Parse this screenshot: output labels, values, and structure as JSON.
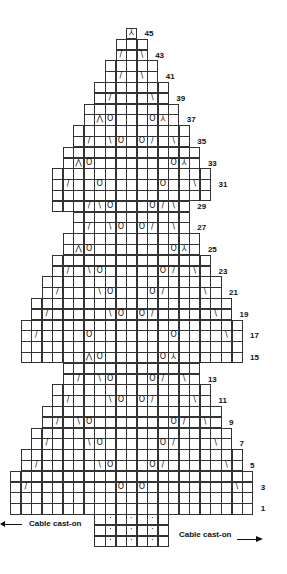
{
  "chart_data": {
    "type": "knitting-chart",
    "grid": {
      "left": 10,
      "top_row45": 28,
      "cell_w": 10.55,
      "cell_h": 10.8,
      "columns": 23
    },
    "rows": [
      {
        "n": 45,
        "range": [
          11,
          11
        ],
        "label": "45",
        "symbols": [
          [
            11,
            "sk2p"
          ]
        ]
      },
      {
        "n": 44,
        "range": [
          10,
          12
        ]
      },
      {
        "n": 43,
        "range": [
          10,
          12
        ],
        "label": "43",
        "symbols": [
          [
            10,
            "k2tog"
          ],
          [
            12,
            "ssk"
          ]
        ]
      },
      {
        "n": 42,
        "range": [
          9,
          13
        ]
      },
      {
        "n": 41,
        "range": [
          9,
          13
        ],
        "label": "41",
        "symbols": [
          [
            10,
            "k2tog"
          ],
          [
            12,
            "ssk"
          ]
        ]
      },
      {
        "n": 40,
        "range": [
          8,
          14
        ]
      },
      {
        "n": 39,
        "range": [
          8,
          14
        ],
        "label": "39",
        "symbols": [
          [
            9,
            "k2tog"
          ],
          [
            13,
            "ssk"
          ]
        ]
      },
      {
        "n": 38,
        "range": [
          7,
          15
        ]
      },
      {
        "n": 37,
        "range": [
          7,
          15
        ],
        "label": "37",
        "symbols": [
          [
            8,
            "k3tog"
          ],
          [
            9,
            "yo"
          ],
          [
            13,
            "yo"
          ],
          [
            14,
            "sk2p"
          ]
        ]
      },
      {
        "n": 36,
        "range": [
          6,
          16
        ]
      },
      {
        "n": 35,
        "range": [
          6,
          16
        ],
        "label": "35",
        "symbols": [
          [
            7,
            "k2tog"
          ],
          [
            9,
            "ssk"
          ],
          [
            10,
            "yo"
          ],
          [
            12,
            "yo"
          ],
          [
            13,
            "k2tog"
          ],
          [
            15,
            "ssk"
          ]
        ]
      },
      {
        "n": 34,
        "range": [
          5,
          17
        ]
      },
      {
        "n": 33,
        "range": [
          5,
          17
        ],
        "label": "33",
        "symbols": [
          [
            6,
            "k3tog"
          ],
          [
            7,
            "yo"
          ],
          [
            15,
            "yo"
          ],
          [
            16,
            "sk2p"
          ]
        ]
      },
      {
        "n": 32,
        "range": [
          4,
          18
        ]
      },
      {
        "n": 31,
        "range": [
          4,
          18
        ],
        "label": "31",
        "symbols": [
          [
            5,
            "k2tog"
          ],
          [
            8,
            "yo"
          ],
          [
            14,
            "yo"
          ],
          [
            17,
            "ssk"
          ]
        ]
      },
      {
        "n": 30,
        "range": [
          4,
          18
        ]
      },
      {
        "n": 29,
        "range": [
          4,
          16
        ],
        "label": "29",
        "symbols": [
          [
            7,
            "k2tog"
          ],
          [
            8,
            "ssk"
          ],
          [
            9,
            "yo"
          ],
          [
            13,
            "yo"
          ],
          [
            14,
            "k2tog"
          ],
          [
            15,
            "ssk"
          ]
        ]
      },
      {
        "n": 28,
        "range": [
          6,
          16
        ]
      },
      {
        "n": 27,
        "range": [
          6,
          16
        ],
        "label": "27",
        "symbols": [
          [
            7,
            "k2tog"
          ],
          [
            9,
            "ssk"
          ],
          [
            10,
            "yo"
          ],
          [
            12,
            "yo"
          ],
          [
            13,
            "k2tog"
          ],
          [
            15,
            "ssk"
          ]
        ]
      },
      {
        "n": 26,
        "range": [
          5,
          17
        ]
      },
      {
        "n": 25,
        "range": [
          5,
          17
        ],
        "label": "25",
        "symbols": [
          [
            6,
            "k3tog"
          ],
          [
            7,
            "yo"
          ],
          [
            15,
            "yo"
          ],
          [
            16,
            "sk2p"
          ]
        ]
      },
      {
        "n": 24,
        "range": [
          4,
          18
        ]
      },
      {
        "n": 23,
        "range": [
          4,
          18
        ],
        "label": "23",
        "symbols": [
          [
            5,
            "k2tog"
          ],
          [
            7,
            "ssk"
          ],
          [
            8,
            "yo"
          ],
          [
            14,
            "yo"
          ],
          [
            15,
            "k2tog"
          ],
          [
            17,
            "ssk"
          ]
        ]
      },
      {
        "n": 22,
        "range": [
          3,
          19
        ]
      },
      {
        "n": 21,
        "range": [
          3,
          19
        ],
        "label": "21",
        "symbols": [
          [
            4,
            "k2tog"
          ],
          [
            8,
            "ssk"
          ],
          [
            9,
            "yo"
          ],
          [
            13,
            "yo"
          ],
          [
            14,
            "k2tog"
          ],
          [
            18,
            "ssk"
          ]
        ]
      },
      {
        "n": 20,
        "range": [
          2,
          20
        ]
      },
      {
        "n": 19,
        "range": [
          2,
          20
        ],
        "label": "19",
        "symbols": [
          [
            3,
            "k2tog"
          ],
          [
            9,
            "ssk"
          ],
          [
            10,
            "yo"
          ],
          [
            12,
            "yo"
          ],
          [
            13,
            "k2tog"
          ],
          [
            19,
            "ssk"
          ]
        ]
      },
      {
        "n": 18,
        "range": [
          1,
          21
        ]
      },
      {
        "n": 17,
        "range": [
          1,
          21
        ],
        "label": "17",
        "symbols": [
          [
            2,
            "k2tog"
          ],
          [
            7,
            "yo"
          ],
          [
            15,
            "yo"
          ],
          [
            20,
            "ssk"
          ]
        ]
      },
      {
        "n": 16,
        "range": [
          1,
          21
        ]
      },
      {
        "n": 15,
        "range": [
          1,
          21
        ],
        "label": "15",
        "symbols": [
          [
            7,
            "k3tog"
          ],
          [
            8,
            "yo"
          ],
          [
            14,
            "yo"
          ],
          [
            15,
            "sk2p"
          ]
        ]
      },
      {
        "n": 14,
        "range": [
          5,
          17
        ]
      },
      {
        "n": 13,
        "range": [
          5,
          17
        ],
        "label": "13",
        "symbols": [
          [
            6,
            "k2tog"
          ],
          [
            8,
            "ssk"
          ],
          [
            9,
            "yo"
          ],
          [
            13,
            "yo"
          ],
          [
            14,
            "k2tog"
          ],
          [
            16,
            "ssk"
          ]
        ]
      },
      {
        "n": 12,
        "range": [
          4,
          18
        ]
      },
      {
        "n": 11,
        "range": [
          4,
          18
        ],
        "label": "11",
        "symbols": [
          [
            5,
            "k2tog"
          ],
          [
            9,
            "ssk"
          ],
          [
            10,
            "yo"
          ],
          [
            12,
            "yo"
          ],
          [
            13,
            "k2tog"
          ],
          [
            17,
            "ssk"
          ]
        ]
      },
      {
        "n": 10,
        "range": [
          3,
          19
        ]
      },
      {
        "n": 9,
        "range": [
          3,
          19
        ],
        "label": "9",
        "symbols": [
          [
            4,
            "k2tog"
          ],
          [
            6,
            "ssk"
          ],
          [
            7,
            "yo"
          ],
          [
            15,
            "yo"
          ],
          [
            16,
            "k2tog"
          ],
          [
            18,
            "ssk"
          ]
        ]
      },
      {
        "n": 8,
        "range": [
          2,
          20
        ]
      },
      {
        "n": 7,
        "range": [
          2,
          20
        ],
        "label": "7",
        "symbols": [
          [
            3,
            "k2tog"
          ],
          [
            7,
            "ssk"
          ],
          [
            8,
            "yo"
          ],
          [
            14,
            "yo"
          ],
          [
            15,
            "k2tog"
          ],
          [
            19,
            "ssk"
          ]
        ]
      },
      {
        "n": 6,
        "range": [
          1,
          21
        ]
      },
      {
        "n": 5,
        "range": [
          1,
          21
        ],
        "label": "5",
        "symbols": [
          [
            2,
            "k2tog"
          ],
          [
            8,
            "ssk"
          ],
          [
            9,
            "yo"
          ],
          [
            13,
            "yo"
          ],
          [
            14,
            "k2tog"
          ],
          [
            20,
            "ssk"
          ]
        ]
      },
      {
        "n": 4,
        "range": [
          0,
          22
        ]
      },
      {
        "n": 3,
        "range": [
          0,
          22
        ],
        "label": "3",
        "symbols": [
          [
            1,
            "k2tog"
          ],
          [
            10,
            "yo"
          ],
          [
            12,
            "yo"
          ],
          [
            21,
            "ssk"
          ]
        ]
      },
      {
        "n": 2,
        "range": [
          0,
          22
        ]
      },
      {
        "n": 1,
        "range": [
          0,
          22
        ],
        "label": "1"
      }
    ],
    "cast_on_block": {
      "rows": 3,
      "range": [
        8,
        14
      ],
      "dot_columns": [
        9,
        11,
        13
      ]
    },
    "symbol_glyphs": {
      "k2tog": "/",
      "ssk": "\\",
      "yo": "O",
      "k3tog": "⋀",
      "sk2p": "⅄"
    }
  },
  "labels": {
    "cast_on_left": "Cable cast-on",
    "cast_on_right": "Cable cast-on"
  }
}
